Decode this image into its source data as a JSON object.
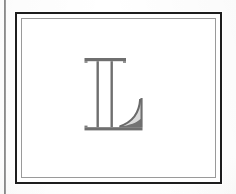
{
  "page": {
    "background_color": "#fbfbfa",
    "paper_color": "#ffffff",
    "width": 236,
    "height": 194
  },
  "gutter_rule": {
    "name": "vertical margin rule",
    "color": "#4a4a4a",
    "orientation": "vertical",
    "x": 4
  },
  "frame": {
    "style": "double-ruled rectangular border",
    "outer_color": "#1d1d1d",
    "outer_width_px": 2,
    "gap_color": "#ffffff",
    "inner_color": "#9a9a9a",
    "inner_width_px": 1
  },
  "initial": {
    "character": "L",
    "style": "outlined serif capital with flared swash terminal",
    "stroke_color": "#6a6a6a",
    "fill_color": "#6f6f6f",
    "alt_text": "Large decorative capital letter L"
  },
  "caption": {
    "text": ""
  }
}
